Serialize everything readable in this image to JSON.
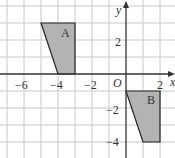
{
  "diagram": {
    "type": "coordinate-grid-transformation",
    "axes": {
      "x_label": "x",
      "y_label": "y",
      "origin_label": "O",
      "x_tick_labels": [
        "−6",
        "−4",
        "−2",
        "2"
      ],
      "y_tick_labels": [
        "2",
        "−2",
        "−4"
      ],
      "x_ticks": [
        -6,
        -4,
        -2,
        2
      ],
      "y_ticks": [
        2,
        -2,
        -4
      ],
      "x_range": [
        -7,
        2.9
      ],
      "y_range": [
        -4.9,
        4.2
      ],
      "grid_step": 1
    },
    "shapes": [
      {
        "label": "A",
        "vertices": [
          [
            -5,
            3
          ],
          [
            -3,
            3
          ],
          [
            -3,
            0
          ],
          [
            -4,
            0
          ]
        ],
        "fill": "#b3b3b3"
      },
      {
        "label": "B",
        "vertices": [
          [
            0,
            -1
          ],
          [
            2,
            -1
          ],
          [
            2,
            -4
          ],
          [
            1,
            -4
          ]
        ],
        "fill": "#b3b3b3"
      }
    ],
    "colors": {
      "grid": "#c8c8c8",
      "axis": "#333333",
      "shape_fill": "#b3b3b3",
      "shape_stroke": "#222222"
    }
  }
}
